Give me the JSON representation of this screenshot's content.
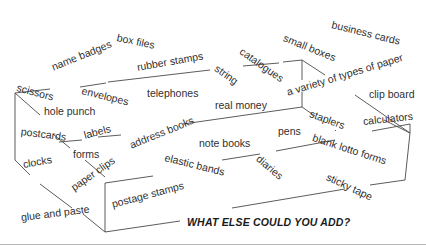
{
  "diagram": {
    "type": "word-box",
    "line_color": "#444444",
    "callout": "WHAT ELSE COULD YOU ADD?",
    "words": [
      {
        "text": "box files",
        "x": 117,
        "y": 32,
        "rot": 12
      },
      {
        "text": "name badges",
        "x": 52,
        "y": 62,
        "rot": -22
      },
      {
        "text": "rubber stamps",
        "x": 137,
        "y": 62,
        "rot": -10
      },
      {
        "text": "business cards",
        "x": 332,
        "y": 19,
        "rot": 14
      },
      {
        "text": "small boxes",
        "x": 284,
        "y": 32,
        "rot": 22
      },
      {
        "text": "catalogues",
        "x": 241,
        "y": 45,
        "rot": 35
      },
      {
        "text": "string",
        "x": 216,
        "y": 62,
        "rot": 35
      },
      {
        "text": "scissors",
        "x": 17,
        "y": 82,
        "rot": 15
      },
      {
        "text": "envelopes",
        "x": 82,
        "y": 85,
        "rot": 14
      },
      {
        "text": "telephones",
        "x": 147,
        "y": 88,
        "rot": 0
      },
      {
        "text": "a variety of types of paper",
        "x": 287,
        "y": 87,
        "rot": -17
      },
      {
        "text": "clip board",
        "x": 369,
        "y": 89,
        "rot": 0
      },
      {
        "text": "real money",
        "x": 215,
        "y": 100,
        "rot": 0
      },
      {
        "text": "hole punch",
        "x": 44,
        "y": 106,
        "rot": 0
      },
      {
        "text": "staplers",
        "x": 310,
        "y": 108,
        "rot": 20
      },
      {
        "text": "calculators",
        "x": 363,
        "y": 116,
        "rot": -6
      },
      {
        "text": "postcards",
        "x": 21,
        "y": 126,
        "rot": 7
      },
      {
        "text": "labels",
        "x": 84,
        "y": 130,
        "rot": -15
      },
      {
        "text": "address books",
        "x": 130,
        "y": 140,
        "rot": -22
      },
      {
        "text": "pens",
        "x": 278,
        "y": 126,
        "rot": 0
      },
      {
        "text": "note books",
        "x": 199,
        "y": 138,
        "rot": 0
      },
      {
        "text": "blank lotto forms",
        "x": 313,
        "y": 132,
        "rot": 18
      },
      {
        "text": "forms",
        "x": 73,
        "y": 149,
        "rot": 0
      },
      {
        "text": "elastic bands",
        "x": 165,
        "y": 152,
        "rot": 14
      },
      {
        "text": "diaries",
        "x": 258,
        "y": 152,
        "rot": 40
      },
      {
        "text": "clocks",
        "x": 23,
        "y": 159,
        "rot": -10
      },
      {
        "text": "paper clips",
        "x": 72,
        "y": 183,
        "rot": -35
      },
      {
        "text": "sticky tape",
        "x": 327,
        "y": 171,
        "rot": 25
      },
      {
        "text": "postage stamps",
        "x": 112,
        "y": 199,
        "rot": -15
      },
      {
        "text": "glue and paste",
        "x": 21,
        "y": 212,
        "rot": -7
      }
    ],
    "callout_pos": {
      "x": 187,
      "y": 217
    }
  }
}
